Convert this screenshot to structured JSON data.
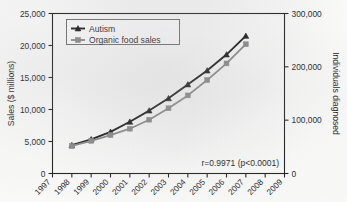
{
  "chart_data": {
    "type": "line",
    "title": "",
    "subtitle": "",
    "xlabel": "",
    "ylabel": "Sales ($ millions)",
    "y2label": "Individuals diagnosed",
    "grid": false,
    "legend_position": "top-left",
    "x": [
      1997,
      1998,
      1999,
      2000,
      2001,
      2002,
      2003,
      2004,
      2005,
      2006,
      2007,
      2008,
      2009
    ],
    "xtick_labels": [
      "1997",
      "1998",
      "1999",
      "2000",
      "2001",
      "2002",
      "2003",
      "2004",
      "2005",
      "2006",
      "2007",
      "2008",
      "2009"
    ],
    "xlim": [
      1997,
      2009
    ],
    "ylim": [
      0,
      25000
    ],
    "ytick_labels": [
      "0",
      "5,000",
      "10,000",
      "15,000",
      "20,000",
      "25,000"
    ],
    "ytick_values": [
      0,
      5000,
      10000,
      15000,
      20000,
      25000
    ],
    "y2lim": [
      0,
      300000
    ],
    "y2tick_labels": [
      "0",
      "100,000",
      "200,000",
      "300,000"
    ],
    "y2tick_values": [
      0,
      100000,
      200000,
      300000
    ],
    "series": [
      {
        "name": "Autism",
        "axis": "right",
        "color": "#111111",
        "marker": "triangle",
        "x": [
          1998,
          1999,
          2000,
          2001,
          2002,
          2003,
          2004,
          2005,
          2006,
          2007
        ],
        "values": [
          53000,
          64000,
          78000,
          97000,
          118000,
          141000,
          167000,
          193000,
          223000,
          258000
        ]
      },
      {
        "name": "Organic food sales",
        "axis": "left",
        "color": "#868686",
        "marker": "square",
        "x": [
          1998,
          1999,
          2000,
          2001,
          2002,
          2003,
          2004,
          2005,
          2006,
          2007
        ],
        "values": [
          4300,
          5100,
          6000,
          7000,
          8400,
          10200,
          12200,
          14600,
          17200,
          20200
        ]
      }
    ],
    "annotations": [
      {
        "text": "r=0.9971 (p<0.0001)",
        "x": 2006.1,
        "y": 1700
      }
    ]
  },
  "legend": {
    "items": [
      {
        "label": "Autism",
        "marker": "triangle-marker",
        "color": "#111111"
      },
      {
        "label": "Organic food sales",
        "marker": "square-marker",
        "color": "#868686"
      }
    ]
  },
  "axes": {
    "left_title": "Sales ($ millions)",
    "right_title": "Individuals diagnosed"
  },
  "annotation": {
    "correlation_text": "r=0.9971 (p<0.0001)"
  }
}
